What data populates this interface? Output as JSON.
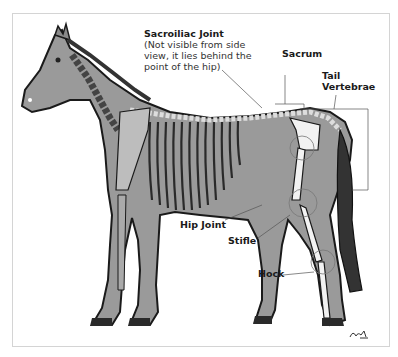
{
  "diagram": {
    "colors": {
      "body_fill": "#9a9a9a",
      "outline": "#1a1a1a",
      "bone": "#f2f2f2",
      "leader_line": "#555555",
      "frame": "#d4d4d4"
    },
    "labels": {
      "sacroiliac": {
        "title": "Sacroiliac Joint",
        "note_line1": "(Not visible from side",
        "note_line2": "view, it lies behind the",
        "note_line3": "point of the hip)"
      },
      "sacrum": "Sacrum",
      "tail_vertebrae_line1": "Tail",
      "tail_vertebrae_line2": "Vertebrae",
      "hip_joint": "Hip Joint",
      "stifle": "Stifle",
      "hock": "Hock"
    },
    "signature": "artist signature"
  }
}
